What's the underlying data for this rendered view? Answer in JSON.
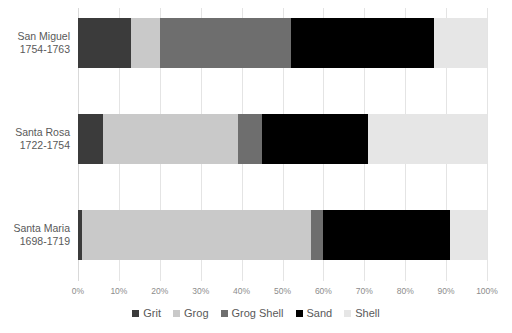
{
  "chart_data": {
    "type": "bar",
    "orientation": "horizontal",
    "stacked": true,
    "stack_mode": "percent",
    "title": "",
    "subtitle": "",
    "xlabel": "",
    "ylabel": "",
    "xlim": [
      0,
      100
    ],
    "grid": true,
    "legend_position": "bottom",
    "categories": [
      {
        "line1": "San Miguel",
        "line2": "1754-1763"
      },
      {
        "line1": "Santa Rosa",
        "line2": "1722-1754"
      },
      {
        "line1": "Santa Maria",
        "line2": "1698-1719"
      }
    ],
    "category_labels": [
      "San Miguel 1754-1763",
      "Santa Rosa 1722-1754",
      "Santa Maria 1698-1719"
    ],
    "xticks": [
      0,
      10,
      20,
      30,
      40,
      50,
      60,
      70,
      80,
      90,
      100
    ],
    "xticklabels": [
      "0%",
      "10%",
      "20%",
      "30%",
      "40%",
      "50%",
      "60%",
      "70%",
      "80%",
      "90%",
      "100%"
    ],
    "series": [
      {
        "name": "Grit",
        "color": "#3b3b3b",
        "values": [
          13,
          6,
          1
        ]
      },
      {
        "name": "Grog",
        "color": "#c9c9c9",
        "values": [
          7,
          33,
          56
        ]
      },
      {
        "name": "Grog Shell",
        "color": "#6e6e6e",
        "values": [
          32,
          6,
          3
        ]
      },
      {
        "name": "Sand",
        "color": "#000000",
        "values": [
          35,
          26,
          31
        ]
      },
      {
        "name": "Shell",
        "color": "#e6e6e6",
        "values": [
          13,
          29,
          9
        ]
      }
    ]
  },
  "style": {
    "gridline_color": "#e4e4e4",
    "tick_label_color": "#8c8c8c",
    "category_label_color": "#595959",
    "legend_label_color": "#595959",
    "background": "#ffffff"
  }
}
